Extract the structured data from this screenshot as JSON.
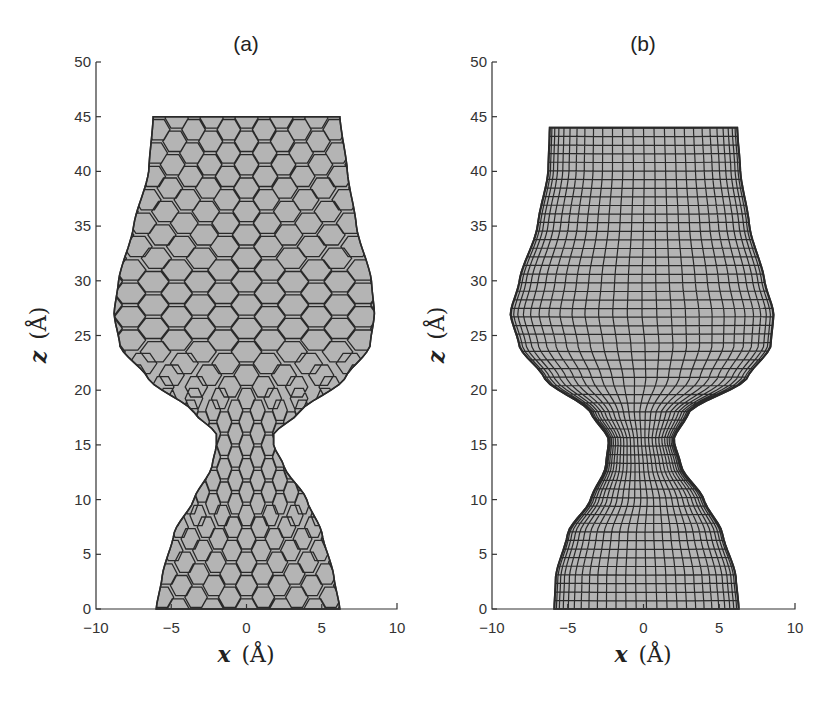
{
  "chart_data": [
    {
      "type": "area",
      "panel_label": "(a)",
      "title": "(a)",
      "xlabel": "x (Å)",
      "ylabel": "z (Å)",
      "xlim": [
        -10,
        10
      ],
      "ylim": [
        0,
        50
      ],
      "xticks": [
        -10,
        -5,
        0,
        5,
        10
      ],
      "yticks": [
        0,
        5,
        10,
        15,
        20,
        25,
        30,
        35,
        40,
        45,
        50
      ],
      "grid": false,
      "description": "Hexagonal-lattice nanowire/nanotube profile with a neck (constriction) near z≈15 Å",
      "mesh": "hexagonal",
      "fill_color": "#b4b4b4",
      "edge_color": "#2a2a2a",
      "profile": {
        "z": [
          0,
          3,
          7,
          10,
          13,
          15,
          16,
          18,
          21,
          24,
          27,
          30,
          35,
          40,
          45
        ],
        "left": [
          -6.0,
          -5.6,
          -4.8,
          -3.5,
          -2.3,
          -2.0,
          -2.0,
          -3.5,
          -6.5,
          -8.4,
          -8.8,
          -8.5,
          -7.5,
          -6.5,
          -6.2
        ],
        "right": [
          6.2,
          5.8,
          5.0,
          4.0,
          2.5,
          1.8,
          1.8,
          3.5,
          6.5,
          8.2,
          8.5,
          8.3,
          7.3,
          6.7,
          6.2
        ]
      }
    },
    {
      "type": "area",
      "panel_label": "(b)",
      "title": "(b)",
      "xlabel": "x (Å)",
      "ylabel": "z (Å)",
      "xlim": [
        -10,
        10
      ],
      "ylim": [
        0,
        50
      ],
      "xticks": [
        -10,
        -5,
        0,
        5,
        10
      ],
      "yticks": [
        0,
        5,
        10,
        15,
        20,
        25,
        30,
        35,
        40,
        45,
        50
      ],
      "grid": false,
      "description": "Continuum (rectangular-mesh) model of the same necked profile",
      "mesh": "rectangular",
      "fill_color": "#b4b4b4",
      "edge_color": "#2a2a2a",
      "profile": {
        "z": [
          0,
          3,
          7,
          10,
          13,
          15.5,
          18,
          21,
          24,
          27,
          30,
          35,
          40,
          44
        ],
        "left": [
          -5.9,
          -5.8,
          -5.0,
          -3.5,
          -2.5,
          -2.3,
          -3.5,
          -6.5,
          -8.2,
          -8.8,
          -8.2,
          -7.0,
          -6.3,
          -6.2
        ],
        "right": [
          6.3,
          6.1,
          5.2,
          4.0,
          2.5,
          2.0,
          3.0,
          6.8,
          8.4,
          8.6,
          8.0,
          7.0,
          6.4,
          6.2
        ]
      }
    }
  ],
  "panels": [
    {
      "title": "(a)",
      "xlabel_var": "x",
      "xlabel_unit": "(Å)",
      "ylabel_var": "z",
      "ylabel_unit": "(Å)",
      "xtick_labels": [
        "−10",
        "−5",
        "0",
        "5",
        "10"
      ],
      "ytick_labels": [
        "0",
        "5",
        "10",
        "15",
        "20",
        "25",
        "30",
        "35",
        "40",
        "45",
        "50"
      ]
    },
    {
      "title": "(b)",
      "xlabel_var": "x",
      "xlabel_unit": "(Å)",
      "ylabel_var": "z",
      "ylabel_unit": "(Å)",
      "xtick_labels": [
        "−10",
        "−5",
        "0",
        "5",
        "10"
      ],
      "ytick_labels": [
        "0",
        "5",
        "10",
        "15",
        "20",
        "25",
        "30",
        "35",
        "40",
        "45",
        "50"
      ]
    }
  ]
}
